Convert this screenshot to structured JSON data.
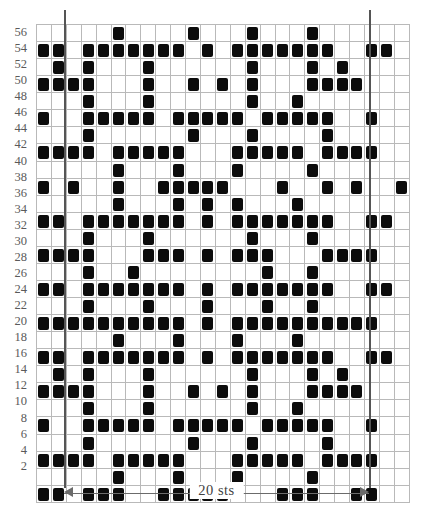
{
  "chart_data": {
    "type": "heatmap",
    "title": "",
    "xlabel": "20 sts",
    "ylabel": "",
    "grid": true,
    "columns": 25,
    "rows": 28,
    "legend": [],
    "filled_color": "#0b0b0b",
    "empty_color": "#ffffff",
    "grid_color": "#b9b9b9",
    "repeat_marker_color": "#555555",
    "repeat_span_stitches": 20,
    "repeat_start_column": 2,
    "repeat_end_column": 22,
    "row_labels_left": [
      56,
      54,
      52,
      50,
      48,
      46,
      44,
      42,
      40,
      38,
      36,
      34,
      32,
      30,
      28,
      26,
      24,
      22,
      20,
      18,
      16,
      14,
      12,
      10,
      8,
      6,
      4,
      2
    ],
    "row_labels_right": [
      55,
      53,
      51,
      49,
      47,
      45,
      43,
      41,
      39,
      37,
      35,
      33,
      31,
      29,
      27,
      25,
      23,
      21,
      19,
      17,
      15,
      13,
      11,
      9,
      7,
      5,
      3,
      1
    ],
    "cells": [
      [
        0,
        0,
        0,
        0,
        0,
        1,
        0,
        0,
        0,
        0,
        1,
        0,
        0,
        0,
        1,
        0,
        0,
        0,
        1,
        0,
        0,
        0,
        0,
        0,
        0
      ],
      [
        1,
        1,
        0,
        1,
        1,
        1,
        1,
        1,
        1,
        1,
        0,
        1,
        0,
        1,
        1,
        1,
        1,
        1,
        1,
        1,
        0,
        0,
        1,
        1,
        0
      ],
      [
        0,
        1,
        0,
        1,
        0,
        0,
        0,
        1,
        0,
        0,
        0,
        0,
        0,
        0,
        1,
        0,
        0,
        0,
        1,
        0,
        1,
        0,
        0,
        0,
        0
      ],
      [
        1,
        1,
        1,
        1,
        0,
        0,
        0,
        1,
        0,
        0,
        1,
        0,
        1,
        0,
        1,
        0,
        0,
        0,
        1,
        1,
        1,
        1,
        0,
        0,
        0
      ],
      [
        0,
        0,
        0,
        1,
        0,
        0,
        0,
        1,
        0,
        0,
        0,
        0,
        0,
        0,
        1,
        0,
        0,
        1,
        0,
        0,
        0,
        0,
        0,
        0,
        0
      ],
      [
        1,
        0,
        0,
        1,
        1,
        1,
        1,
        1,
        0,
        1,
        1,
        1,
        1,
        1,
        0,
        1,
        1,
        1,
        1,
        1,
        0,
        0,
        1,
        0,
        0
      ],
      [
        0,
        0,
        0,
        1,
        0,
        0,
        0,
        0,
        0,
        0,
        1,
        0,
        0,
        0,
        1,
        0,
        0,
        0,
        0,
        1,
        0,
        0,
        0,
        0,
        0
      ],
      [
        1,
        1,
        1,
        1,
        0,
        1,
        1,
        1,
        1,
        1,
        0,
        0,
        0,
        1,
        1,
        1,
        1,
        1,
        0,
        1,
        1,
        1,
        1,
        0,
        0
      ],
      [
        0,
        0,
        0,
        0,
        0,
        1,
        0,
        0,
        0,
        1,
        0,
        0,
        0,
        1,
        0,
        0,
        0,
        0,
        1,
        0,
        0,
        0,
        0,
        0,
        0
      ],
      [
        1,
        0,
        1,
        0,
        0,
        1,
        0,
        0,
        1,
        1,
        1,
        1,
        1,
        0,
        0,
        0,
        1,
        0,
        0,
        1,
        0,
        1,
        0,
        0,
        1
      ],
      [
        0,
        0,
        0,
        0,
        0,
        1,
        0,
        0,
        0,
        1,
        0,
        1,
        0,
        1,
        0,
        0,
        0,
        1,
        0,
        0,
        0,
        0,
        0,
        0,
        0
      ],
      [
        1,
        1,
        0,
        1,
        1,
        1,
        1,
        1,
        1,
        1,
        0,
        1,
        0,
        1,
        1,
        1,
        1,
        1,
        1,
        1,
        0,
        0,
        1,
        1,
        0
      ],
      [
        0,
        0,
        0,
        1,
        0,
        0,
        0,
        1,
        0,
        0,
        0,
        0,
        0,
        0,
        1,
        0,
        0,
        0,
        1,
        0,
        0,
        0,
        0,
        0,
        0
      ],
      [
        1,
        1,
        1,
        1,
        0,
        0,
        0,
        1,
        1,
        1,
        0,
        1,
        0,
        1,
        1,
        1,
        0,
        0,
        0,
        1,
        1,
        1,
        1,
        0,
        0
      ],
      [
        0,
        0,
        0,
        1,
        0,
        0,
        1,
        0,
        0,
        0,
        0,
        0,
        0,
        0,
        0,
        1,
        0,
        0,
        1,
        0,
        0,
        0,
        0,
        0,
        0
      ],
      [
        1,
        1,
        0,
        1,
        1,
        1,
        1,
        1,
        1,
        1,
        0,
        1,
        0,
        1,
        1,
        1,
        1,
        1,
        1,
        1,
        0,
        0,
        1,
        1,
        0
      ],
      [
        0,
        0,
        0,
        1,
        0,
        0,
        0,
        1,
        0,
        0,
        0,
        1,
        0,
        0,
        0,
        1,
        0,
        0,
        1,
        0,
        0,
        0,
        0,
        0,
        0
      ],
      [
        1,
        1,
        1,
        1,
        1,
        1,
        1,
        1,
        1,
        1,
        0,
        1,
        0,
        1,
        1,
        1,
        1,
        1,
        1,
        1,
        1,
        1,
        1,
        0,
        0
      ],
      [
        0,
        0,
        0,
        0,
        0,
        1,
        0,
        0,
        0,
        1,
        0,
        0,
        0,
        1,
        0,
        0,
        0,
        1,
        0,
        0,
        0,
        0,
        0,
        0,
        0
      ],
      [
        1,
        1,
        0,
        1,
        1,
        1,
        1,
        1,
        1,
        1,
        0,
        1,
        0,
        1,
        1,
        1,
        1,
        1,
        1,
        1,
        0,
        0,
        1,
        1,
        0
      ],
      [
        0,
        1,
        0,
        1,
        0,
        0,
        0,
        1,
        0,
        0,
        0,
        0,
        0,
        0,
        1,
        0,
        0,
        0,
        1,
        0,
        1,
        0,
        0,
        0,
        0
      ],
      [
        1,
        1,
        1,
        1,
        0,
        0,
        0,
        1,
        0,
        0,
        1,
        0,
        1,
        0,
        1,
        0,
        0,
        0,
        1,
        1,
        1,
        1,
        0,
        0,
        0
      ],
      [
        0,
        0,
        0,
        1,
        0,
        0,
        0,
        1,
        0,
        0,
        0,
        0,
        0,
        0,
        1,
        0,
        0,
        1,
        0,
        0,
        0,
        0,
        0,
        0,
        0
      ],
      [
        1,
        0,
        0,
        1,
        1,
        1,
        1,
        1,
        0,
        1,
        1,
        1,
        1,
        1,
        0,
        1,
        1,
        1,
        1,
        1,
        0,
        0,
        1,
        0,
        0
      ],
      [
        0,
        0,
        0,
        1,
        0,
        0,
        0,
        0,
        0,
        0,
        1,
        0,
        0,
        0,
        1,
        0,
        0,
        0,
        0,
        1,
        0,
        0,
        0,
        0,
        0
      ],
      [
        1,
        1,
        1,
        1,
        0,
        1,
        1,
        1,
        1,
        1,
        0,
        0,
        0,
        1,
        1,
        1,
        1,
        1,
        0,
        1,
        1,
        1,
        1,
        0,
        0
      ],
      [
        0,
        0,
        0,
        0,
        0,
        1,
        0,
        0,
        0,
        1,
        0,
        0,
        0,
        1,
        0,
        0,
        0,
        0,
        1,
        0,
        0,
        0,
        0,
        0,
        0
      ],
      [
        1,
        1,
        0,
        1,
        1,
        1,
        0,
        0,
        1,
        1,
        1,
        1,
        1,
        0,
        0,
        0,
        1,
        1,
        1,
        0,
        0,
        1,
        1,
        0,
        0
      ]
    ]
  },
  "annotations": {
    "width_label": "20  sts"
  }
}
